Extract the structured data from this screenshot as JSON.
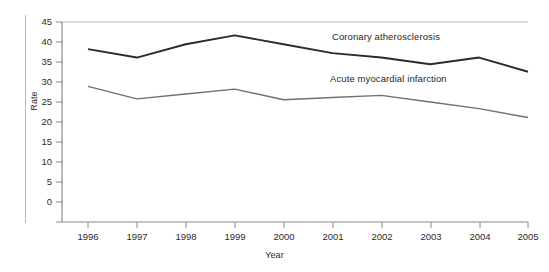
{
  "chart_data": {
    "type": "line",
    "title": "",
    "xlabel": "Year",
    "ylabel": "Rate",
    "categories": [
      "1996",
      "1997",
      "1998",
      "1999",
      "2000",
      "2001",
      "2002",
      "2003",
      "2004",
      "2005"
    ],
    "x": [
      1996,
      1997,
      1998,
      1999,
      2000,
      2001,
      2002,
      2003,
      2004,
      2005
    ],
    "xlim": [
      1996,
      2005
    ],
    "ylim": [
      0,
      45
    ],
    "yticks": [
      0,
      5,
      10,
      15,
      20,
      25,
      30,
      35,
      40,
      45
    ],
    "grid": false,
    "legend_position": "inline-annotations",
    "series": [
      {
        "name": "Coronary atherosclerosis",
        "color": "#2b2b2b",
        "values": [
          38.9,
          37.0,
          40.0,
          42.0,
          40.0,
          38.0,
          37.0,
          35.5,
          37.0,
          33.8
        ]
      },
      {
        "name": "Acute myocardial infarction",
        "color": "#707070",
        "values": [
          30.5,
          27.7,
          28.8,
          29.9,
          27.5,
          28.0,
          28.5,
          27.0,
          25.5,
          23.5
        ]
      }
    ],
    "annotations": [
      {
        "text": "Coronary atherosclerosis",
        "x_px": 332,
        "y_px": 31
      },
      {
        "text": "Acute myocardial infarction",
        "x_px": 330,
        "y_px": 73
      }
    ]
  },
  "axis": {
    "y_title": "Rate",
    "x_title": "Year",
    "y_tick_labels": [
      "45",
      "40",
      "35",
      "30",
      "25",
      "20",
      "15",
      "10",
      "5",
      "0"
    ],
    "x_tick_labels": [
      "1996",
      "1997",
      "1998",
      "1999",
      "2000",
      "2001",
      "2002",
      "2003",
      "2004",
      "2005"
    ]
  },
  "colors": {
    "series_upper": "#2b2b2b",
    "series_lower": "#707070",
    "axis": "#8a8a8a",
    "top_rule": "#b9b9b9",
    "text": "#2b2b2b",
    "background": "#ffffff"
  }
}
